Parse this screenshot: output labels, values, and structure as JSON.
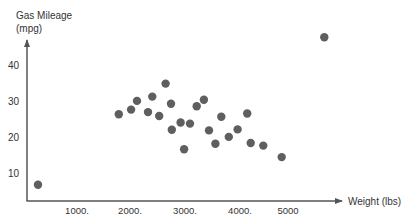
{
  "chart_data": {
    "type": "scatter",
    "title": "",
    "xlabel": "Weight (lbs)",
    "ylabel_line1": "Gas Mileage",
    "ylabel_line2": "(mpg)",
    "ylabel": "Gas Mileage (mpg)",
    "x_ticks": [
      {
        "value": 1000,
        "label": "1000."
      },
      {
        "value": 2000,
        "label": "2000."
      },
      {
        "value": 3000,
        "label": "3000."
      },
      {
        "value": 4000,
        "label": "4000."
      },
      {
        "value": 5000,
        "label": "5000"
      }
    ],
    "y_ticks": [
      {
        "value": 10,
        "label": "10"
      },
      {
        "value": 20,
        "label": "20"
      },
      {
        "value": 30,
        "label": "30"
      },
      {
        "value": 40,
        "label": "40"
      }
    ],
    "grid": false,
    "legend": null,
    "point_color": "#5f5f5f",
    "axis_color": "#555555",
    "series": [
      {
        "name": "Cars",
        "points": [
          {
            "x": 300,
            "y": 7
          },
          {
            "x": 1810,
            "y": 26.6
          },
          {
            "x": 2040,
            "y": 27.9
          },
          {
            "x": 2150,
            "y": 30.3
          },
          {
            "x": 2435,
            "y": 31.5
          },
          {
            "x": 2355,
            "y": 27.2
          },
          {
            "x": 2565,
            "y": 26.1
          },
          {
            "x": 2685,
            "y": 35.1
          },
          {
            "x": 2785,
            "y": 29.5
          },
          {
            "x": 2800,
            "y": 22.3
          },
          {
            "x": 2965,
            "y": 24.3
          },
          {
            "x": 3140,
            "y": 24.0
          },
          {
            "x": 3030,
            "y": 16.9
          },
          {
            "x": 3265,
            "y": 28.8
          },
          {
            "x": 3400,
            "y": 30.6
          },
          {
            "x": 3495,
            "y": 22.1
          },
          {
            "x": 3615,
            "y": 18.4
          },
          {
            "x": 3725,
            "y": 25.9
          },
          {
            "x": 3865,
            "y": 20.3
          },
          {
            "x": 4030,
            "y": 22.4
          },
          {
            "x": 4210,
            "y": 26.8
          },
          {
            "x": 4275,
            "y": 18.6
          },
          {
            "x": 4510,
            "y": 17.9
          },
          {
            "x": 4855,
            "y": 14.7
          },
          {
            "x": 5650,
            "y": 48
          }
        ]
      }
    ]
  }
}
